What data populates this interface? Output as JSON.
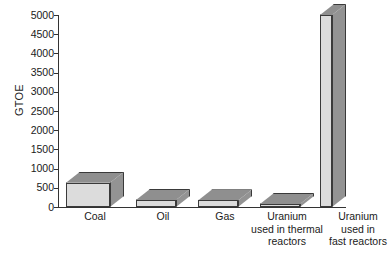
{
  "chart_data": {
    "type": "bar",
    "title": "",
    "subtitle": "",
    "xlabel": "",
    "ylabel": "GTOE",
    "ylim": [
      0,
      5000
    ],
    "ytick_step": 500,
    "grid": false,
    "legend": "none",
    "style": "3d-bars",
    "categories": [
      "Coal",
      "Oil",
      "Gas",
      "Uranium used in thermal reactors",
      "Uranium used in fast reactors"
    ],
    "category_label_lines": [
      [
        "Coal"
      ],
      [
        "Oil"
      ],
      [
        "Gas"
      ],
      [
        "Uranium",
        "used in thermal",
        "reactors"
      ],
      [
        "Uranium",
        "used in",
        "fast reactors"
      ]
    ],
    "values": [
      630,
      180,
      170,
      70,
      5000
    ],
    "ytick_labels": [
      "0",
      "500",
      "1000",
      "1500",
      "2000",
      "2500",
      "3000",
      "3500",
      "4000",
      "4500",
      "5000"
    ],
    "ytick_values": [
      0,
      500,
      1000,
      1500,
      2000,
      2500,
      3000,
      3500,
      4000,
      4500,
      5000
    ]
  },
  "colors": {
    "background": "#ffffff",
    "bar_front": "#dcdcdc",
    "bar_top": "#8f8f8f",
    "bar_side": "#939393",
    "bar_outline": "#3a3a3a",
    "axis": "#333333",
    "text": "#1a1a1a"
  }
}
